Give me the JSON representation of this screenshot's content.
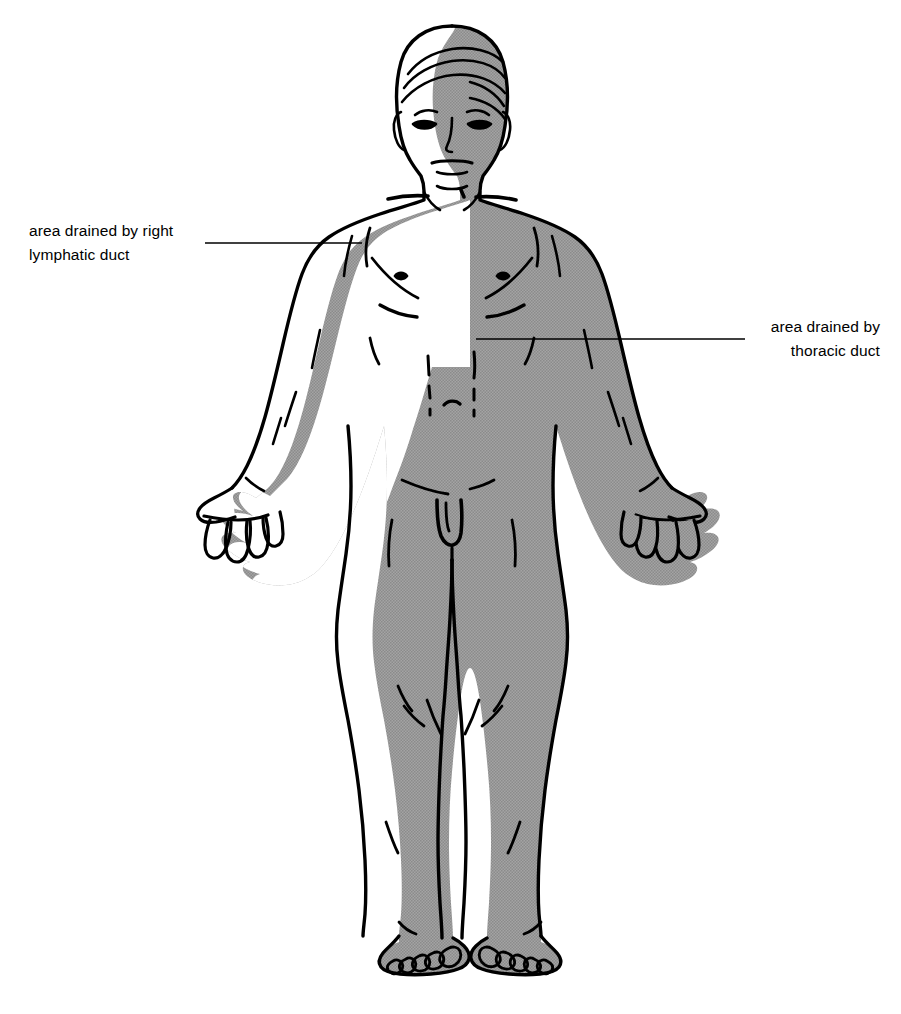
{
  "figure": {
    "type": "anatomical-diagram",
    "colors": {
      "shaded_region": "#999999",
      "unshaded_region": "#ffffff",
      "outline": "#000000",
      "background": "#ffffff",
      "leader_line": "#000000"
    }
  },
  "labels": {
    "left": {
      "line1": "area drained by right",
      "line2": "lymphatic duct",
      "region": "unshaded-white",
      "leader": {
        "x1": 205,
        "y1": 243,
        "x2": 362,
        "y2": 243
      }
    },
    "right": {
      "line1": "area drained by",
      "line2": "thoracic duct",
      "region": "shaded-gray",
      "leader": {
        "x1": 476,
        "y1": 339,
        "x2": 745,
        "y2": 339
      }
    }
  },
  "regions": [
    {
      "name": "right-lymphatic-duct-territory",
      "fill": "#ffffff",
      "covers": "right side of head and neck, right shoulder, right arm and hand, right side of thorax"
    },
    {
      "name": "thoracic-duct-territory",
      "fill": "#999999",
      "covers": "left side of head and neck, left shoulder, left arm and hand, left thorax, entire abdomen, pelvis, both legs and feet"
    }
  ]
}
